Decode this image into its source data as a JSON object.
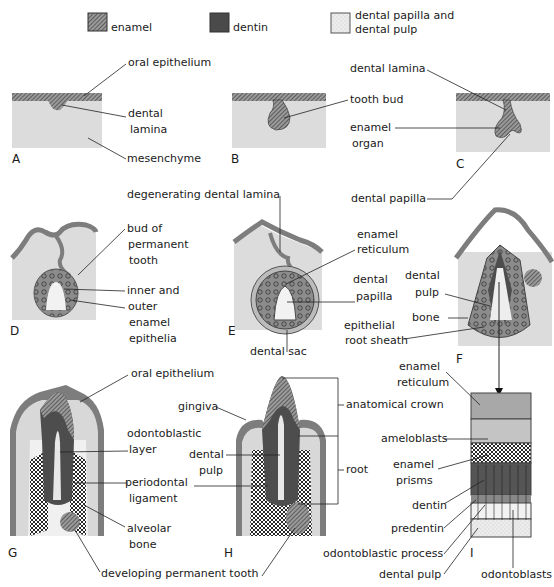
{
  "legend": {
    "items": [
      {
        "label": "enamel",
        "pattern": "hatched",
        "color": "#7a7a7a"
      },
      {
        "label": "dentin",
        "pattern": "solid",
        "color": "#4a4a4a"
      },
      {
        "label": "dental papilla and",
        "label2": "dental pulp",
        "pattern": "stipple",
        "color": "#e4e4e4"
      }
    ]
  },
  "panels": {
    "A": {
      "letter": "A",
      "labels": [
        "oral epithelium",
        "dental",
        "lamina",
        "mesenchyme"
      ]
    },
    "B": {
      "letter": "B",
      "labels": [
        "tooth bud"
      ]
    },
    "C": {
      "letter": "C",
      "labels": [
        "dental lamina",
        "enamel",
        "organ",
        "dental papilla"
      ]
    },
    "D": {
      "letter": "D",
      "labels": [
        "bud of",
        "permanent",
        "tooth",
        "inner and",
        "outer",
        "enamel",
        "epithelia"
      ]
    },
    "E": {
      "letter": "E",
      "labels": [
        "degenerating  dental lamina",
        "enamel",
        "reticulum",
        "dental",
        "papilla",
        "dental sac"
      ]
    },
    "F": {
      "letter": "F",
      "labels": [
        "dental",
        "pulp",
        "bone",
        "epithelial",
        "root sheath"
      ]
    },
    "G": {
      "letter": "G",
      "labels": [
        "oral epithelium",
        "odontoblastic",
        "layer",
        "periodontal",
        "ligament",
        "alveolar",
        "bone",
        "developing permanent tooth"
      ]
    },
    "H": {
      "letter": "H",
      "labels": [
        "gingiva",
        "dental",
        "pulp",
        "anatomical crown",
        "root"
      ]
    },
    "I": {
      "letter": "I",
      "labels": [
        "enamel",
        "reticulum",
        "ameloblasts",
        "enamel",
        "prisms",
        "dentin",
        "predentin",
        "odontoblastic process",
        "dental pulp",
        "odontoblasts"
      ]
    }
  },
  "colors": {
    "tissue": "#dcdcdc",
    "enamel": "#8a8a8a",
    "dentin": "#4d4d4d",
    "pulp": "#efefef",
    "bone": "#111111",
    "line": "#222222"
  }
}
